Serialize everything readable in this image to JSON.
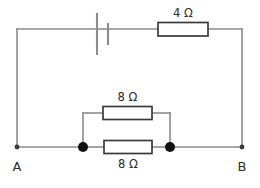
{
  "figure": {
    "kind": "electrical-circuit-diagram",
    "background_color": "#ffffff",
    "wire_color": "#8c8c8c",
    "component_outline_color": "#3b3b3b",
    "node_color": "#111111",
    "text_color": "#2b2b2b"
  },
  "components": {
    "battery": {
      "name": "battery",
      "symbol": "cell",
      "label": ""
    },
    "resistor_top": {
      "name": "resistor-4-ohm",
      "label": "4 Ω",
      "resistance": 4,
      "unit": "Ω",
      "position": "top-branch"
    },
    "resistor_upper_parallel": {
      "name": "resistor-8-ohm-upper",
      "label": "8 Ω",
      "resistance": 8,
      "unit": "Ω",
      "position": "parallel-upper"
    },
    "resistor_lower_parallel": {
      "name": "resistor-8-ohm-lower",
      "label": "8 Ω",
      "resistance": 8,
      "unit": "Ω",
      "position": "parallel-lower"
    }
  },
  "terminals": {
    "left": {
      "name": "terminal-a",
      "label": "A"
    },
    "right": {
      "name": "terminal-b",
      "label": "B"
    }
  },
  "junctions": [
    {
      "name": "junction-left",
      "label": ""
    },
    {
      "name": "junction-right",
      "label": ""
    }
  ]
}
